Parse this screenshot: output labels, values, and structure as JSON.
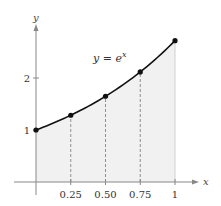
{
  "chart_data": {
    "type": "area",
    "title": "",
    "function_label": {
      "lhs": "y",
      "eq": "=",
      "base": "e",
      "exp": "x"
    },
    "xlabel": "x",
    "ylabel": "y",
    "x_ticks": [
      {
        "value": 0.25,
        "label": "0.25"
      },
      {
        "value": 0.5,
        "label": "0.50"
      },
      {
        "value": 0.75,
        "label": "0.75"
      },
      {
        "value": 1,
        "label": "1"
      }
    ],
    "y_ticks": [
      {
        "value": 1,
        "label": "1"
      },
      {
        "value": 2,
        "label": "2"
      }
    ],
    "points": [
      {
        "x": 0,
        "y": 1.0
      },
      {
        "x": 0.25,
        "y": 1.284
      },
      {
        "x": 0.5,
        "y": 1.649
      },
      {
        "x": 0.75,
        "y": 2.117
      },
      {
        "x": 1,
        "y": 2.718
      }
    ],
    "shaded_region": {
      "from": 0,
      "to": 1
    },
    "xlim": [
      0,
      1.2
    ],
    "ylim": [
      0,
      3.0
    ],
    "grid": false,
    "colors": {
      "curve": "#111111",
      "fill": "#f1f1f1",
      "axis": "#888888",
      "dash": "#777777"
    }
  }
}
